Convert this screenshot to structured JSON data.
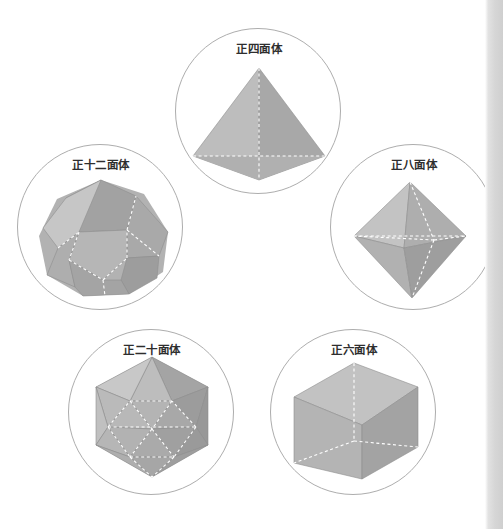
{
  "page": {
    "background_color": "#ffffff",
    "width": 503,
    "height": 529,
    "edge_strip": {
      "name": "page-edge-strip",
      "x": 485,
      "color": "#d6d6d6"
    }
  },
  "palette": {
    "circle_outline": "#adadad",
    "hidden_edge": "#ffffff",
    "face_light": "#c4c4c4",
    "face_mid": "#b4b4b4",
    "face_mid_dark": "#a6a6a6",
    "face_dark": "#9a9a9a",
    "face_darker": "#8f8f8f",
    "label_text": "#2e2e2e"
  },
  "figure": {
    "title": "",
    "solids": [
      {
        "id": "tetrahedron",
        "label": "正四面体",
        "faces": 4,
        "face_shape": "triangle",
        "circle": {
          "cx": 258,
          "cy": 111,
          "r": 83
        }
      },
      {
        "id": "dodecahedron",
        "label": "正十二面体",
        "faces": 12,
        "face_shape": "pentagon",
        "circle": {
          "cx": 101,
          "cy": 227,
          "r": 83
        }
      },
      {
        "id": "octahedron",
        "label": "正八面体",
        "faces": 8,
        "face_shape": "triangle",
        "circle": {
          "cx": 413,
          "cy": 227,
          "r": 83
        }
      },
      {
        "id": "icosahedron",
        "label": "正二十面体",
        "faces": 20,
        "face_shape": "triangle",
        "circle": {
          "cx": 151,
          "cy": 412,
          "r": 83
        }
      },
      {
        "id": "hexahedron",
        "label": "正六面体",
        "faces": 6,
        "face_shape": "square",
        "circle": {
          "cx": 353,
          "cy": 412,
          "r": 83
        }
      }
    ]
  }
}
